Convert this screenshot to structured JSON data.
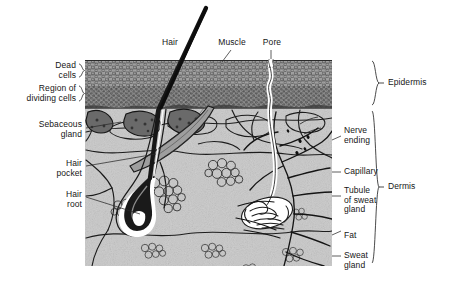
{
  "figure": {
    "type": "anatomical-diagram",
    "ink_color": "#1a1a1a",
    "epidermis_fill": "#8d8d8d",
    "dermis_fill": "#c9c9c9",
    "paper_color": "#ffffff"
  },
  "labels": {
    "top": [
      {
        "id": "hair",
        "text": "Hair"
      },
      {
        "id": "muscle",
        "text": "Muscle"
      },
      {
        "id": "pore",
        "text": "Pore"
      }
    ],
    "left": [
      {
        "id": "dead-cells",
        "text": "Dead\ncells"
      },
      {
        "id": "region-dividing-cells",
        "text": "Region of\ndividing cells"
      },
      {
        "id": "sebaceous-gland",
        "text": "Sebaceous\ngland"
      },
      {
        "id": "hair-pocket",
        "text": "Hair\npocket"
      },
      {
        "id": "hair-root",
        "text": "Hair\nroot"
      }
    ],
    "right": [
      {
        "id": "nerve-ending",
        "text": "Nerve\nending"
      },
      {
        "id": "capillary",
        "text": "Capillary"
      },
      {
        "id": "tubule-of-sweat-gland",
        "text": "Tubule\nof sweat\ngland"
      },
      {
        "id": "fat",
        "text": "Fat"
      },
      {
        "id": "sweat-gland",
        "text": "Sweat\ngland"
      }
    ],
    "layers": [
      {
        "id": "epidermis",
        "text": "Epidermis"
      },
      {
        "id": "dermis",
        "text": "Dermis"
      }
    ]
  }
}
